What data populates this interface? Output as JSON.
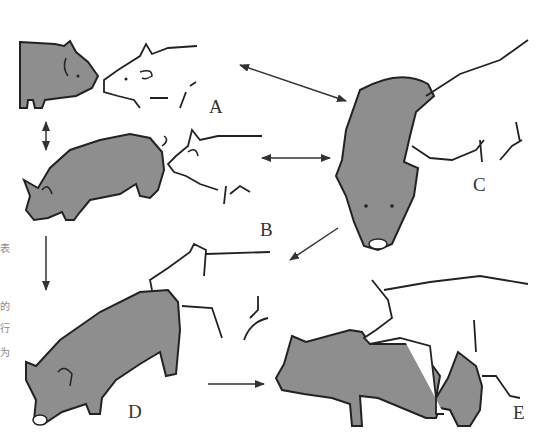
{
  "figure": {
    "type": "behavior-sequence-illustration",
    "colors": {
      "dark_pig_fill": "#8e8e8e",
      "outline": "#222222",
      "background": "#ffffff",
      "label": "#333333"
    },
    "panels": [
      {
        "id": "A",
        "label": "A",
        "description": "Dark sow and white boar nose-to-nose contact"
      },
      {
        "id": "B",
        "label": "B",
        "description": "White boar sniffing the rear of dark sow"
      },
      {
        "id": "C",
        "label": "C",
        "description": "Boar resting head on standing sow's back, viewed from front"
      },
      {
        "id": "D",
        "label": "D",
        "description": "Boar placing chin on sow's back / attempting mount"
      },
      {
        "id": "E",
        "label": "E",
        "description": "Boar mounted on sow"
      }
    ],
    "arrows": [
      {
        "from": "A",
        "to": "B",
        "kind": "double"
      },
      {
        "from": "A",
        "to": "C",
        "kind": "double"
      },
      {
        "from": "B",
        "to": "C",
        "kind": "double"
      },
      {
        "from": "B",
        "to": "D",
        "kind": "single"
      },
      {
        "from": "C",
        "to": "D",
        "kind": "single"
      },
      {
        "from": "D",
        "to": "E",
        "kind": "single"
      }
    ],
    "side_text": [
      "表",
      "的",
      "行",
      "为"
    ]
  }
}
